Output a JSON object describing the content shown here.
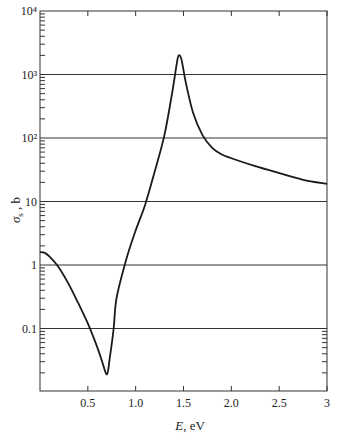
{
  "chart_data": {
    "type": "line",
    "title": "",
    "xlabel": "E, eV",
    "ylabel": "σs , b",
    "xlim": [
      0,
      3
    ],
    "ylim": [
      0.01,
      10000
    ],
    "yscale": "log",
    "grid": {
      "horizontal": true,
      "vertical": false
    },
    "legend": null,
    "x_ticks": [
      0.5,
      1.0,
      1.5,
      2.0,
      2.5,
      3
    ],
    "x_tick_labels": [
      "0.5",
      "1.0",
      "1.5",
      "2.0",
      "2.5",
      "3"
    ],
    "y_ticks": [
      0.1,
      1,
      10,
      100,
      1000,
      10000
    ],
    "y_tick_labels": [
      "0.1",
      "1",
      "10",
      "10²",
      "10³",
      "10⁴"
    ],
    "series": [
      {
        "name": "scattering cross section",
        "x": [
          0.0,
          0.05,
          0.1,
          0.2,
          0.3,
          0.4,
          0.5,
          0.6,
          0.65,
          0.7,
          0.73,
          0.77,
          0.8,
          0.9,
          1.0,
          1.1,
          1.2,
          1.3,
          1.38,
          1.43,
          1.45,
          1.48,
          1.52,
          1.6,
          1.7,
          1.8,
          1.9,
          2.0,
          2.25,
          2.5,
          2.75,
          3.0
        ],
        "y": [
          1.6,
          1.55,
          1.35,
          0.9,
          0.5,
          0.25,
          0.12,
          0.05,
          0.03,
          0.019,
          0.035,
          0.1,
          0.3,
          1.2,
          3.5,
          9,
          30,
          110,
          500,
          1500,
          2000,
          1700,
          800,
          250,
          110,
          70,
          55,
          48,
          36,
          28,
          22,
          19
        ]
      }
    ],
    "annotations": []
  },
  "labels": {
    "y_axis_title_main": "σ",
    "y_axis_title_sub": "s",
    "y_axis_title_unit": " , b",
    "x_axis_title_italic": "E",
    "x_axis_title_unit": ", eV"
  }
}
